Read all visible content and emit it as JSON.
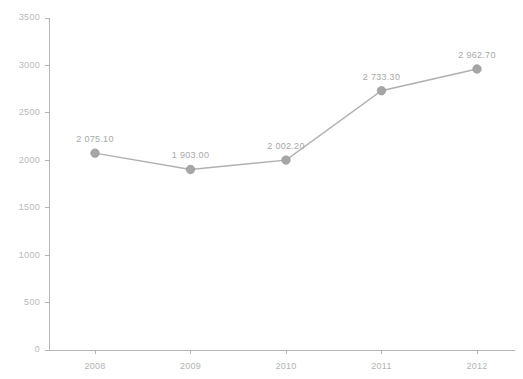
{
  "chart_data": {
    "type": "line",
    "title": "",
    "subtitle": "",
    "xlabel": "",
    "ylabel": "",
    "categories": [
      "2008",
      "2009",
      "2010",
      "2011",
      "2012"
    ],
    "values": [
      2075.1,
      1903.0,
      2002.2,
      2733.3,
      2962.7
    ],
    "point_labels": [
      "2 075.10",
      "1 903.00",
      "2 002.20",
      "2 733.30",
      "2 962.70"
    ],
    "ylim": [
      0,
      3500
    ],
    "ytick_values": [
      0,
      500,
      1000,
      1500,
      2000,
      2500,
      3000,
      3500
    ],
    "ytick_labels": [
      "0",
      "500",
      "1000",
      "1500",
      "2000",
      "2500",
      "3000",
      "3500"
    ],
    "grid": false,
    "legend": false,
    "legend_position": "none",
    "series": [
      {
        "name": "",
        "values": [
          2075.1,
          1903.0,
          2002.2,
          2733.3,
          2962.7
        ]
      }
    ],
    "colors": {
      "line": "#b0b0b0",
      "marker": "#a6a6a6",
      "axis": "#b5b5b5",
      "tick_text": "#b3b3b3",
      "label_text": "#a8a8a8",
      "background": "#ffffff"
    }
  }
}
